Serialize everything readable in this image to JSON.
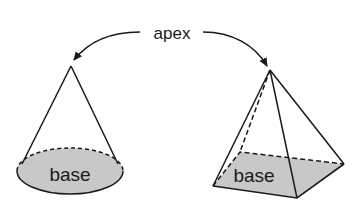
{
  "diagram": {
    "apex_label": "apex",
    "cone": {
      "base_label": "base",
      "base_fill": "#c8c8c8"
    },
    "pyramid": {
      "base_label": "base",
      "base_fill": "#c8c8c8"
    },
    "stroke_color": "#1a1a1a"
  }
}
